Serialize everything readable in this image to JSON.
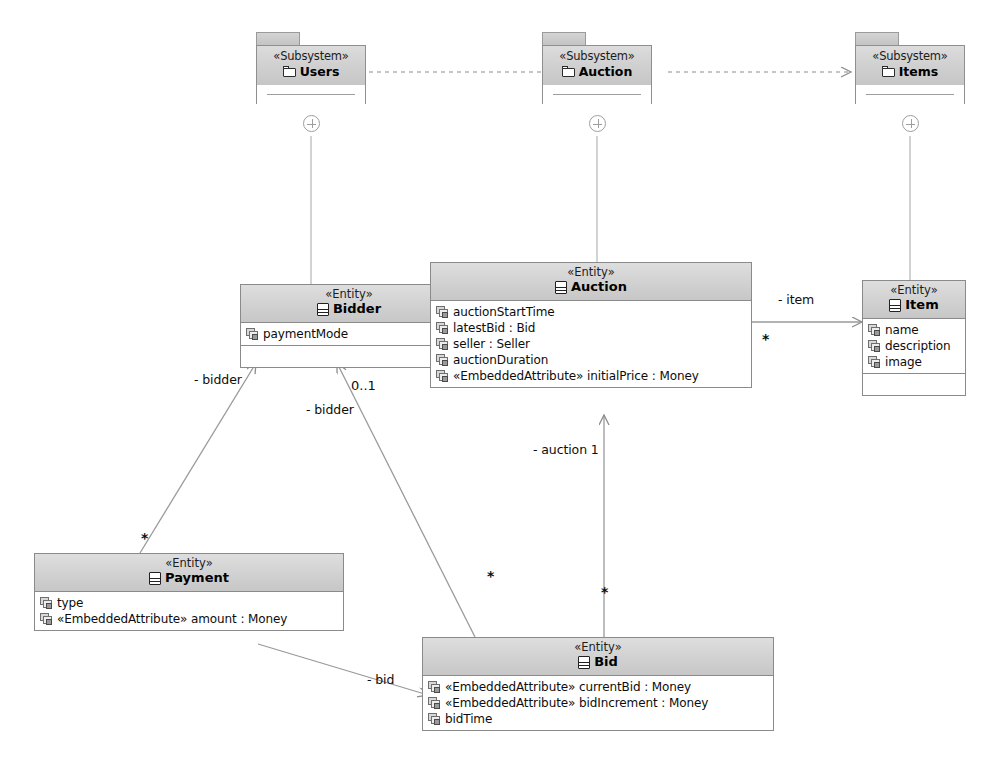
{
  "diagram": {
    "type": "uml-class-diagram",
    "colors": {
      "node_border": "#8a8a8a",
      "header_fill": "#d2d2d2",
      "body_fill": "#ffffff",
      "edge": "#8c8c8c",
      "text": "#0d0d0d"
    }
  },
  "packages": [
    {
      "id": "users",
      "stereotype": "«Subsystem»",
      "name": "Users",
      "icon": "folder-icon"
    },
    {
      "id": "auction",
      "stereotype": "«Subsystem»",
      "name": "Auction",
      "icon": "folder-icon"
    },
    {
      "id": "items",
      "stereotype": "«Subsystem»",
      "name": "Items",
      "icon": "folder-icon"
    }
  ],
  "classes": [
    {
      "id": "bidder",
      "stereotype": "«Entity»",
      "name": "Bidder",
      "icon": "entity-icon",
      "attributes": [
        {
          "text": "paymentMode",
          "icon": "attribute-icon"
        }
      ],
      "has_empty_compartment": true
    },
    {
      "id": "auction",
      "stereotype": "«Entity»",
      "name": "Auction",
      "icon": "entity-icon",
      "attributes": [
        {
          "text": "auctionStartTime",
          "icon": "attribute-icon"
        },
        {
          "text": "latestBid : Bid",
          "icon": "attribute-icon"
        },
        {
          "text": "seller : Seller",
          "icon": "attribute-icon"
        },
        {
          "text": "auctionDuration",
          "icon": "attribute-icon"
        },
        {
          "text": "«EmbeddedAttribute» initialPrice : Money",
          "icon": "attribute-icon"
        }
      ],
      "has_empty_compartment": false
    },
    {
      "id": "item",
      "stereotype": "«Entity»",
      "name": "Item",
      "icon": "entity-icon",
      "attributes": [
        {
          "text": "name",
          "icon": "attribute-icon"
        },
        {
          "text": "description",
          "icon": "attribute-icon"
        },
        {
          "text": "image",
          "icon": "attribute-icon"
        }
      ],
      "has_empty_compartment": true
    },
    {
      "id": "payment",
      "stereotype": "«Entity»",
      "name": "Payment",
      "icon": "entity-icon",
      "attributes": [
        {
          "text": "type",
          "icon": "attribute-icon"
        },
        {
          "text": "«EmbeddedAttribute» amount : Money",
          "icon": "attribute-icon"
        }
      ],
      "has_empty_compartment": false
    },
    {
      "id": "bid",
      "stereotype": "«Entity»",
      "name": "Bid",
      "icon": "entity-icon",
      "attributes": [
        {
          "text": "«EmbeddedAttribute» currentBid : Money",
          "icon": "attribute-icon"
        },
        {
          "text": "«EmbeddedAttribute» bidIncrement : Money",
          "icon": "attribute-icon"
        },
        {
          "text": "bidTime",
          "icon": "attribute-icon"
        }
      ],
      "has_empty_compartment": false
    }
  ],
  "edge_labels": {
    "bidder_payment_role": "- bidder",
    "bidder_bid_role": "- bidder",
    "bidder_bid_mult": "0..1",
    "payment_mult": "*",
    "bid_to_bidder_mult": "*",
    "auction_role": "- auction 1",
    "bid_to_auction_mult": "*",
    "item_role": "- item",
    "auction_item_mult": "*",
    "payment_bid_role": "- bid"
  }
}
